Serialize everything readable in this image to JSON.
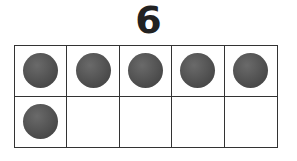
{
  "title": "6",
  "ten_frame": {
    "rows": 2,
    "columns": 5,
    "filled_count": 6,
    "cells": [
      {
        "filled": true
      },
      {
        "filled": true
      },
      {
        "filled": true
      },
      {
        "filled": true
      },
      {
        "filled": true
      },
      {
        "filled": true
      },
      {
        "filled": false
      },
      {
        "filled": false
      },
      {
        "filled": false
      },
      {
        "filled": false
      }
    ],
    "counter_color": "#555555",
    "line_color": "#333333"
  }
}
